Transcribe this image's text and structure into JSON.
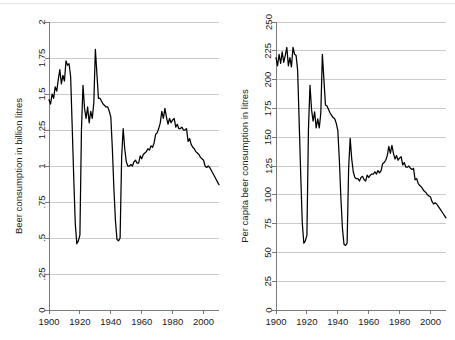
{
  "figure": {
    "background_color": "#ffffff",
    "line_color": "#000000",
    "grid_color": "#b4b4b4",
    "axis_color": "#6b6b6b"
  },
  "chart_data": [
    {
      "type": "line",
      "title": "",
      "xlabel": "",
      "ylabel": "Beer consumption in billion litres",
      "xlim": [
        1900,
        2010
      ],
      "ylim": [
        0,
        2
      ],
      "grid": true,
      "legend": "none",
      "xticks": [
        1900,
        1920,
        1940,
        1960,
        1980,
        2000
      ],
      "xtick_labels": [
        "1900",
        "1920",
        "1940",
        "1960",
        "1980",
        "2000"
      ],
      "yticks": [
        0,
        0.25,
        0.5,
        0.75,
        1,
        1.25,
        1.5,
        1.75,
        2
      ],
      "ytick_labels": [
        "0",
        ".25",
        ".5",
        ".75",
        "1",
        "1.25",
        "1.5",
        "1.75",
        "2"
      ],
      "x": [
        1900,
        1901,
        1902,
        1903,
        1904,
        1905,
        1906,
        1907,
        1908,
        1909,
        1910,
        1911,
        1912,
        1913,
        1914,
        1915,
        1916,
        1917,
        1918,
        1919,
        1920,
        1921,
        1922,
        1923,
        1924,
        1925,
        1926,
        1927,
        1928,
        1929,
        1930,
        1931,
        1932,
        1933,
        1934,
        1935,
        1936,
        1937,
        1938,
        1939,
        1940,
        1941,
        1942,
        1943,
        1944,
        1945,
        1946,
        1947,
        1948,
        1949,
        1950,
        1951,
        1952,
        1953,
        1954,
        1955,
        1956,
        1957,
        1958,
        1959,
        1960,
        1961,
        1962,
        1963,
        1964,
        1965,
        1966,
        1967,
        1968,
        1969,
        1970,
        1971,
        1972,
        1973,
        1974,
        1975,
        1976,
        1977,
        1978,
        1979,
        1980,
        1981,
        1982,
        1983,
        1984,
        1985,
        1986,
        1987,
        1988,
        1989,
        1990,
        1991,
        1992,
        1993,
        1994,
        1995,
        1996,
        1997,
        1998,
        1999,
        2000,
        2001,
        2002,
        2003,
        2004,
        2005,
        2006,
        2007,
        2008,
        2009,
        2010
      ],
      "values": [
        1.46,
        1.43,
        1.5,
        1.47,
        1.55,
        1.52,
        1.6,
        1.67,
        1.57,
        1.63,
        1.59,
        1.73,
        1.7,
        1.71,
        1.62,
        1.28,
        0.92,
        0.6,
        0.46,
        0.48,
        0.52,
        1.25,
        1.56,
        1.4,
        1.33,
        1.41,
        1.3,
        1.38,
        1.33,
        1.44,
        1.81,
        1.64,
        1.47,
        1.47,
        1.45,
        1.43,
        1.42,
        1.41,
        1.41,
        1.38,
        1.34,
        1.12,
        0.84,
        0.62,
        0.49,
        0.48,
        0.5,
        1.06,
        1.26,
        1.12,
        1.03,
        1.0,
        1.0,
        1.01,
        1.0,
        1.03,
        1.04,
        1.02,
        1.02,
        1.07,
        1.05,
        1.08,
        1.09,
        1.1,
        1.12,
        1.11,
        1.14,
        1.13,
        1.16,
        1.22,
        1.23,
        1.26,
        1.3,
        1.38,
        1.33,
        1.4,
        1.34,
        1.29,
        1.33,
        1.3,
        1.32,
        1.33,
        1.27,
        1.29,
        1.26,
        1.26,
        1.27,
        1.25,
        1.25,
        1.26,
        1.17,
        1.19,
        1.15,
        1.13,
        1.12,
        1.1,
        1.09,
        1.08,
        1.06,
        1.05,
        1.04,
        1.0,
        0.99,
        1.0,
        0.99,
        0.97,
        0.95,
        0.93,
        0.91,
        0.89,
        0.87
      ]
    },
    {
      "type": "line",
      "title": "",
      "xlabel": "",
      "ylabel": "Per capita beer consumption in litres",
      "xlim": [
        1900,
        2010
      ],
      "ylim": [
        0,
        250
      ],
      "grid": true,
      "legend": "none",
      "xticks": [
        1900,
        1920,
        1940,
        1960,
        1980,
        2000
      ],
      "xtick_labels": [
        "1900",
        "1920",
        "1940",
        "1960",
        "1980",
        "2000"
      ],
      "yticks": [
        0,
        25,
        50,
        75,
        100,
        125,
        150,
        175,
        200,
        225,
        250
      ],
      "ytick_labels": [
        "0",
        "25",
        "50",
        "75",
        "100",
        "125",
        "150",
        "175",
        "200",
        "225",
        "250"
      ],
      "x": [
        1900,
        1901,
        1902,
        1903,
        1904,
        1905,
        1906,
        1907,
        1908,
        1909,
        1910,
        1911,
        1912,
        1913,
        1914,
        1915,
        1916,
        1917,
        1918,
        1919,
        1920,
        1921,
        1922,
        1923,
        1924,
        1925,
        1926,
        1927,
        1928,
        1929,
        1930,
        1931,
        1932,
        1933,
        1934,
        1935,
        1936,
        1937,
        1938,
        1939,
        1940,
        1941,
        1942,
        1943,
        1944,
        1945,
        1946,
        1947,
        1948,
        1949,
        1950,
        1951,
        1952,
        1953,
        1954,
        1955,
        1956,
        1957,
        1958,
        1959,
        1960,
        1961,
        1962,
        1963,
        1964,
        1965,
        1966,
        1967,
        1968,
        1969,
        1970,
        1971,
        1972,
        1973,
        1974,
        1975,
        1976,
        1977,
        1978,
        1979,
        1980,
        1981,
        1982,
        1983,
        1984,
        1985,
        1986,
        1987,
        1988,
        1989,
        1990,
        1991,
        1992,
        1993,
        1994,
        1995,
        1996,
        1997,
        1998,
        1999,
        2000,
        2001,
        2002,
        2003,
        2004,
        2005,
        2006,
        2007,
        2008,
        2009,
        2010
      ],
      "values": [
        219,
        212,
        222,
        214,
        224,
        215,
        221,
        228,
        212,
        219,
        211,
        228,
        222,
        221,
        208,
        163,
        117,
        76,
        58,
        60,
        65,
        157,
        195,
        174,
        164,
        172,
        158,
        166,
        158,
        171,
        222,
        200,
        178,
        177,
        174,
        171,
        169,
        167,
        166,
        162,
        156,
        130,
        97,
        71,
        57,
        56,
        58,
        123,
        149,
        131,
        120,
        115,
        114,
        114,
        112,
        115,
        116,
        113,
        112,
        117,
        115,
        117,
        118,
        118,
        120,
        118,
        121,
        119,
        121,
        127,
        128,
        130,
        134,
        142,
        136,
        143,
        136,
        131,
        134,
        130,
        132,
        133,
        126,
        128,
        124,
        124,
        125,
        123,
        122,
        123,
        113,
        114,
        110,
        108,
        107,
        105,
        103,
        102,
        100,
        99,
        98,
        94,
        92,
        93,
        92,
        90,
        88,
        86,
        84,
        82,
        80
      ]
    }
  ]
}
